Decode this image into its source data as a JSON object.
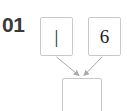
{
  "diagram": {
    "step_label": "01",
    "nodes": [
      {
        "id": "left-operand",
        "value": "|"
      },
      {
        "id": "right-operand",
        "value": "6"
      },
      {
        "id": "result",
        "value": ""
      }
    ],
    "connectors": [
      {
        "id": "left-to-result",
        "from": "left-operand",
        "to": "result",
        "arrowhead": "down"
      },
      {
        "id": "right-to-result",
        "from": "right-operand",
        "to": "result",
        "arrowhead": "down"
      }
    ],
    "colors": {
      "box_border": "#c9c9c9",
      "box_fill": "#ffffff",
      "label_text": "#3a3a3a",
      "value_text": "#1c1c1c",
      "connector": "#a9a9a9",
      "background": "#ffffff"
    }
  }
}
